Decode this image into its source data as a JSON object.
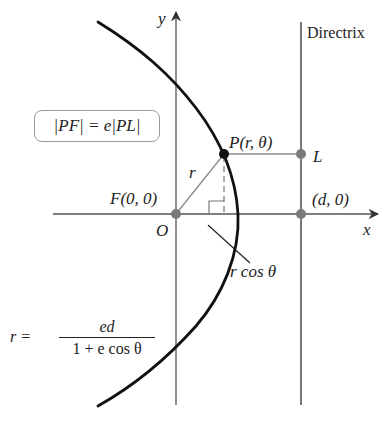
{
  "diagram": {
    "axes": {
      "x_label": "x",
      "y_label": "y",
      "origin_label": "O"
    },
    "directrix": {
      "label": "Directrix"
    },
    "points": {
      "P": "P(r, θ)",
      "L": "L",
      "F": "F(0, 0)",
      "D": "(d, 0)"
    },
    "segment_labels": {
      "r": "r",
      "r_cos_theta": "r cos θ"
    },
    "boxed_equation": "|PF| = e|PL|",
    "polar_equation": {
      "lhs": "r =",
      "numerator": "ed",
      "denominator": "1 + e cos θ"
    },
    "colors": {
      "curve": "#111111",
      "axes": "#555555",
      "gray_lines": "#8a8a8a",
      "point_P": "#111111",
      "gray_points": "#7a7a7a",
      "box_border": "#9a9a9a"
    }
  }
}
